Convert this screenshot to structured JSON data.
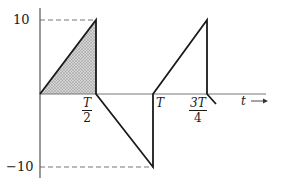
{
  "diagram": {
    "y_labels": {
      "top": "10",
      "bottom": "−10"
    },
    "x_labels": {
      "half_period": {
        "num": "T",
        "den": "2"
      },
      "period": "T",
      "three_quarter": {
        "num": "3T",
        "den": "4"
      },
      "axis": "t",
      "axis_arrow": "→"
    },
    "colors": {
      "line": "#1a1a1a",
      "axis": "#555555",
      "shade": "#b8b8b8",
      "dash": "#777777"
    }
  }
}
